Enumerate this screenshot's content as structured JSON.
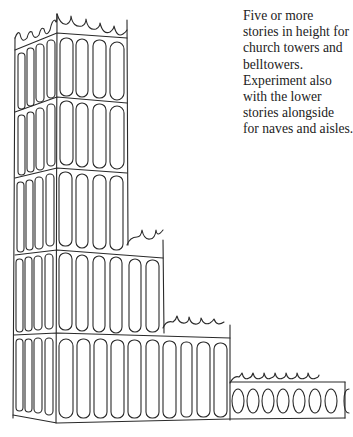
{
  "caption": {
    "lines": [
      "Five or more",
      "stories in height for",
      "church towers and",
      "belltowers.",
      "Experiment also",
      "with the lower",
      "stories alongside",
      "for naves and aisles."
    ]
  },
  "illustration": {
    "subject": "stepped tower sketch",
    "tiers": 5,
    "colors": {
      "ink": "#2a2a2a",
      "paper": "#ffffff"
    }
  }
}
